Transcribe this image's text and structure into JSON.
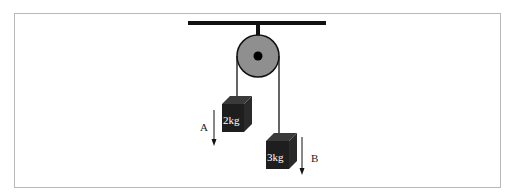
{
  "diagram": {
    "type": "pulley-system",
    "masses": [
      {
        "label": "2kg",
        "arrow_label": "A",
        "direction": "down"
      },
      {
        "label": "3kg",
        "arrow_label": "B",
        "direction": "down"
      }
    ],
    "colors": {
      "pulley_fill": "#8f8f8f",
      "block_fill": "#1e1e1e",
      "line": "#000000",
      "frame": "#b8b8b8"
    }
  }
}
